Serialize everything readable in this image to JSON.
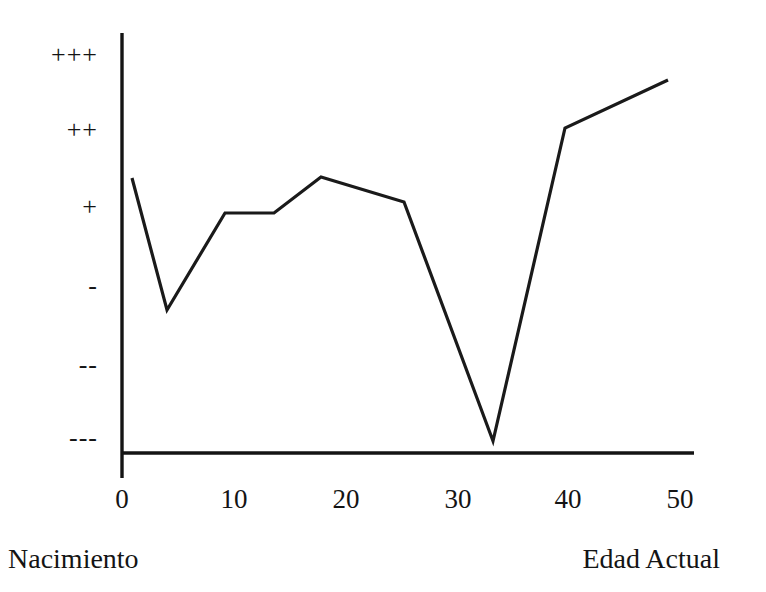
{
  "chart_data": {
    "type": "line",
    "title": "",
    "xlabel": "",
    "ylabel": "",
    "xlim": [
      0,
      51
    ],
    "ylim": [
      0,
      7
    ],
    "grid": false,
    "legend": null,
    "x_tick_labels": [
      "0",
      "10",
      "20",
      "30",
      "40",
      "50"
    ],
    "x_tick_values": [
      0,
      10,
      20,
      30,
      40,
      50
    ],
    "y_tick_labels": [
      "+++",
      "++",
      "+",
      "-",
      "--",
      "---"
    ],
    "y_tick_levels": [
      6,
      5,
      4,
      3,
      2,
      1
    ],
    "axis_captions": {
      "left": "Nacimiento",
      "right": "Edad Actual"
    },
    "series": [
      {
        "name": "",
        "color": "#1a1a1a",
        "points": [
          {
            "x": 0.9,
            "y": 4.38
          },
          {
            "x": 4.0,
            "y": 2.64
          },
          {
            "x": 9.2,
            "y": 3.91
          },
          {
            "x": 13.6,
            "y": 3.9
          },
          {
            "x": 17.8,
            "y": 4.38
          },
          {
            "x": 25.2,
            "y": 4.05
          },
          {
            "x": 33.2,
            "y": 0.92
          },
          {
            "x": 39.6,
            "y": 5.02
          },
          {
            "x": 48.8,
            "y": 5.66
          }
        ]
      }
    ]
  },
  "y_axis": {
    "labels": [
      {
        "text": "+++",
        "top": 42
      },
      {
        "text": "++",
        "top": 117
      },
      {
        "text": "+",
        "top": 194
      },
      {
        "text": "-",
        "top": 273
      },
      {
        "text": "--",
        "top": 352
      },
      {
        "text": "---",
        "top": 425
      }
    ]
  },
  "x_axis": {
    "labels": [
      {
        "text": "0",
        "left": 87
      },
      {
        "text": "10",
        "left": 199
      },
      {
        "text": "20",
        "left": 311
      },
      {
        "text": "30",
        "left": 423
      },
      {
        "text": "40",
        "left": 533
      },
      {
        "text": "50",
        "left": 645
      }
    ]
  },
  "captions": {
    "left": "Nacimiento",
    "right": "Edad Actual"
  },
  "geometry": {
    "axis_color": "#141414",
    "line_color": "#1a1a1a",
    "line_width": 3.2,
    "axis_width": 3.4,
    "y_axis_x": 122,
    "y_axis_top": 33,
    "y_axis_bottom": 478,
    "x_axis_y": 453,
    "x_axis_left": 122,
    "x_axis_right": 694,
    "polyline_points": "132,178 167,310 225,213 274,213 321,177 404,202 493,441 565,128 668,80"
  }
}
